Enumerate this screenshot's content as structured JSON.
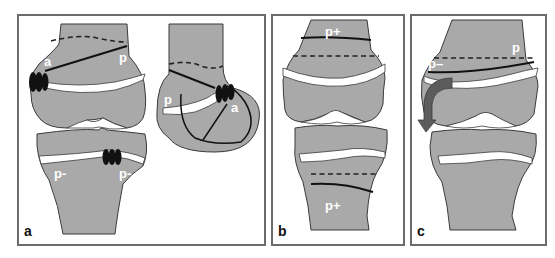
{
  "figure": {
    "colors": {
      "bone": "#a9a9a9",
      "physis": "#ffffff",
      "outline": "#3a3a3a",
      "arrow": "#555555",
      "border": "#6b6b6b"
    }
  },
  "panels": [
    {
      "id": "a",
      "letter": "a",
      "labels": {
        "femur_anterior": "a",
        "femur_posterior": "p",
        "tibia_left": "p-",
        "tibia_right": "p-",
        "lateral_p": "p",
        "lateral_a": "a"
      },
      "elements": [
        "femur with staple and oblique solid line",
        "tibia with staple",
        "lateral view with staple and drill lines",
        "dashed line above physis"
      ]
    },
    {
      "id": "b",
      "letter": "b",
      "labels": {
        "top": "p+",
        "bottom": "p+"
      },
      "elements": [
        "solid line and dashed line on femur",
        "dashed line and solid line on tibia"
      ]
    },
    {
      "id": "c",
      "letter": "c",
      "labels": {
        "right": "p",
        "left": "p–"
      },
      "elements": [
        "dashed line and oblique solid line on femur",
        "curved gray arrow showing angular deformity"
      ]
    }
  ]
}
